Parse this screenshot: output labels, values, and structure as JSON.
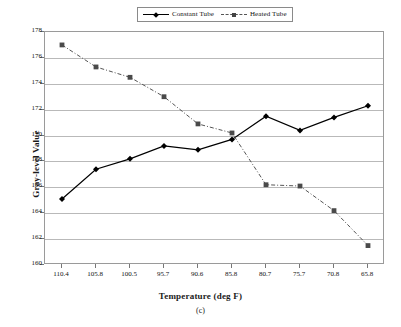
{
  "chart_data": {
    "type": "line",
    "title": "",
    "caption": "(c)",
    "xlabel": "Temperature (deg F)",
    "ylabel": "Gray-level Value",
    "categories": [
      "110.4",
      "105.8",
      "100.5",
      "95.7",
      "90.6",
      "85.8",
      "80.7",
      "75.7",
      "70.8",
      "65.8"
    ],
    "ylim": [
      160,
      178
    ],
    "yticks": [
      160,
      162,
      164,
      166,
      168,
      170,
      172,
      174,
      176,
      178
    ],
    "ytick_labels": [
      "160",
      "162",
      "164",
      "166",
      "168",
      "170",
      "172",
      "174",
      "176",
      "178"
    ],
    "grid": true,
    "legend_position": "top-center",
    "series": [
      {
        "name": "Constant Tube",
        "marker": "diamond",
        "line_style": "solid",
        "color": "#000000",
        "values": [
          165.1,
          167.4,
          168.2,
          169.2,
          168.9,
          169.7,
          171.5,
          170.4,
          171.4,
          172.3
        ]
      },
      {
        "name": "Heated Tube",
        "marker": "square",
        "line_style": "dash-dot",
        "color": "#555555",
        "values": [
          177.0,
          175.3,
          174.5,
          173.0,
          170.9,
          170.2,
          166.2,
          166.1,
          164.2,
          161.5
        ]
      }
    ]
  },
  "legend": {
    "entries": [
      {
        "label": "Constant Tube"
      },
      {
        "label": "Heated Tube"
      }
    ]
  }
}
